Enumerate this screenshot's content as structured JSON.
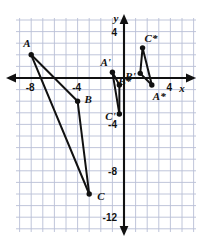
{
  "figure": {
    "background_color": "#ffffff",
    "grid_color": "#b9c0d6",
    "axis_color": "#111111",
    "point_color": "#111111",
    "segment_color": "#111111"
  },
  "axes": {
    "x_label": "x",
    "y_label": "y",
    "x_ticks": [
      {
        "value": -8,
        "label": "-8"
      },
      {
        "value": -4,
        "label": "-4"
      },
      {
        "value": 4,
        "label": "4"
      }
    ],
    "y_ticks": [
      {
        "value": 4,
        "label": "4"
      },
      {
        "value": -4,
        "label": "-4"
      },
      {
        "value": -8,
        "label": "-8"
      },
      {
        "value": -12,
        "label": "-12"
      }
    ],
    "x_range": [
      -10,
      6
    ],
    "y_range": [
      -13,
      6
    ],
    "grid": true
  },
  "chart_data": {
    "type": "scatter",
    "xlabel": "x",
    "ylabel": "y",
    "xlim": [
      -10,
      6
    ],
    "ylim": [
      -13,
      6
    ],
    "grid": true,
    "series": [
      {
        "name": "Triangle ABC",
        "points": [
          {
            "label": "A",
            "x": -8,
            "y": 2,
            "label_dx": -8,
            "label_dy": -8
          },
          {
            "label": "B",
            "x": -4,
            "y": -2,
            "label_dx": 7,
            "label_dy": 2
          },
          {
            "label": "C",
            "x": -3,
            "y": -10,
            "label_dx": 8,
            "label_dy": 6
          }
        ],
        "edges": [
          [
            "A",
            "B"
          ],
          [
            "B",
            "C"
          ],
          [
            "C",
            "A"
          ]
        ]
      },
      {
        "name": "Triangle A'B'C'",
        "points": [
          {
            "label": "A'",
            "x": -1,
            "y": 0.5,
            "label_dx": -12,
            "label_dy": -6
          },
          {
            "label": "B'",
            "x": -0.4,
            "y": -0.6,
            "label_dx": 6,
            "label_dy": -5
          },
          {
            "label": "C'",
            "x": -0.4,
            "y": -3.1,
            "label_dx": -14,
            "label_dy": 6
          }
        ],
        "edges": [
          [
            "A'",
            "B'"
          ],
          [
            "B'",
            "C'"
          ],
          [
            "C'",
            "A'"
          ]
        ]
      },
      {
        "name": "Triangle A*B*C*",
        "points": [
          {
            "label": "C*",
            "x": 1.6,
            "y": 2.6,
            "label_dx": 2,
            "label_dy": -6
          },
          {
            "label": "B*",
            "x": 1.4,
            "y": 0.4,
            "label_dx": -22,
            "label_dy": 12
          },
          {
            "label": "A*",
            "x": 2.4,
            "y": -0.6,
            "label_dx": 1,
            "label_dy": 15
          }
        ],
        "edges": [
          [
            "C*",
            "B*"
          ],
          [
            "B*",
            "A*"
          ],
          [
            "A*",
            "C*"
          ]
        ]
      }
    ]
  }
}
